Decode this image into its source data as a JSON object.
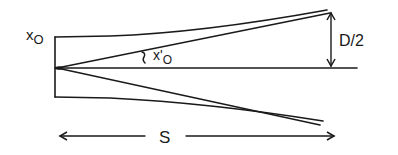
{
  "diagram": {
    "labels": {
      "x0": "x",
      "x0_sub": "O",
      "x0_prime": "x'",
      "x0_prime_sub": "O",
      "d_half": "D/2",
      "s": "S"
    },
    "colors": {
      "stroke": "#1a1a1a",
      "background": "#ffffff"
    }
  }
}
